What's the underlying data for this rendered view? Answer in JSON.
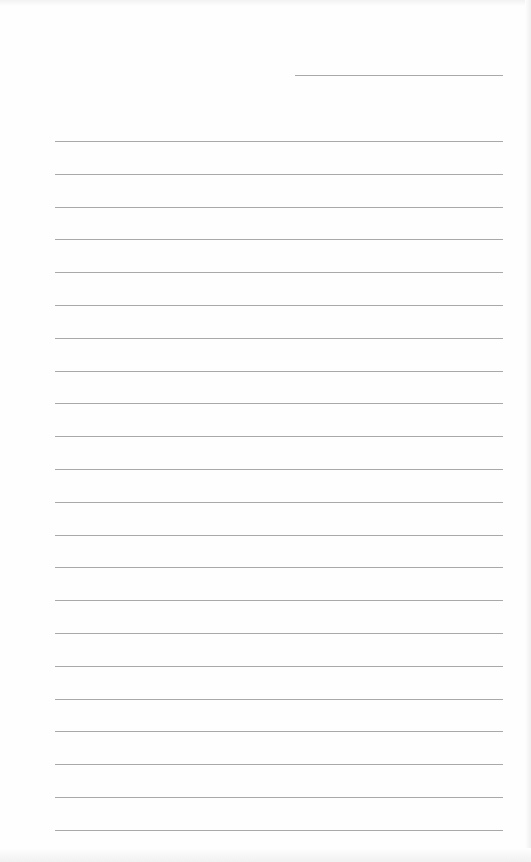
{
  "document": {
    "type": "lined-paper",
    "header_line": {
      "x": 295,
      "y": 75,
      "width": 208
    },
    "ruled_lines": {
      "count": 22,
      "start_y": 141,
      "spacing": 32.8,
      "left_x": 55,
      "width": 448
    },
    "colors": {
      "paper": "#fefefe",
      "rule": "#9a9a9a"
    }
  }
}
